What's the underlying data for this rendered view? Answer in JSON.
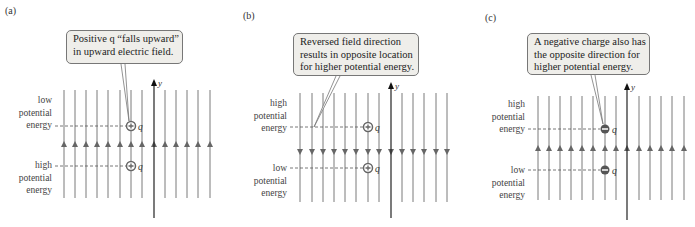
{
  "panels": [
    {
      "id": "a",
      "label": "(a)",
      "callout": [
        "Positive q “falls upward”",
        "in upward electric field."
      ],
      "upper_label": [
        "low",
        "potential",
        "energy"
      ],
      "lower_label": [
        "high",
        "potential",
        "energy"
      ],
      "field_direction": "up",
      "charge_sign": "+",
      "charge_symbol": "q",
      "axis_label": "y"
    },
    {
      "id": "b",
      "label": "(b)",
      "callout": [
        "Reversed field direction",
        "results in opposite location",
        "for higher potential energy."
      ],
      "upper_label": [
        "high",
        "potential",
        "energy"
      ],
      "lower_label": [
        "low",
        "potential",
        "energy"
      ],
      "field_direction": "down",
      "charge_sign": "+",
      "charge_symbol": "q",
      "axis_label": "y"
    },
    {
      "id": "c",
      "label": "(c)",
      "callout": [
        "A negative charge also has",
        "the opposite direction for",
        "higher potential energy."
      ],
      "upper_label": [
        "high",
        "potential",
        "energy"
      ],
      "lower_label": [
        "low",
        "potential",
        "energy"
      ],
      "field_direction": "up",
      "charge_sign": "-",
      "charge_symbol": "q",
      "axis_label": "y"
    }
  ],
  "colors": {
    "field_line": "#7a7a7a",
    "axis": "#222222",
    "callout_bg": "#efeeea",
    "dashed": "#555555"
  }
}
